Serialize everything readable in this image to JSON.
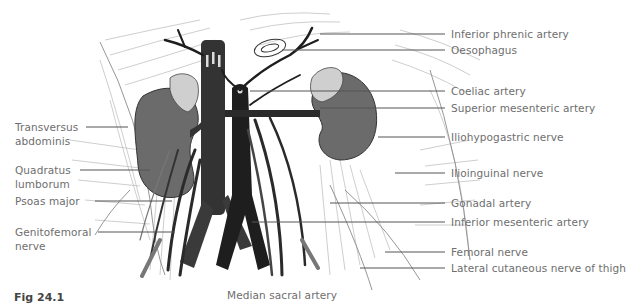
{
  "figure": {
    "caption": "Fig 24.1"
  },
  "labels": {
    "left": [
      {
        "id": "transversus-abdominis",
        "lines": [
          "Transversus",
          "abdominis"
        ]
      },
      {
        "id": "quadratus-lumborum",
        "lines": [
          "Quadratus",
          "lumborum"
        ]
      },
      {
        "id": "psoas-major",
        "lines": [
          "Psoas major"
        ]
      },
      {
        "id": "genitofemoral-nerve",
        "lines": [
          "Genitofemoral",
          "nerve"
        ]
      }
    ],
    "right": [
      {
        "id": "inferior-phrenic-artery",
        "text": "Inferior phrenic artery"
      },
      {
        "id": "oesophagus",
        "text": "Oesophagus"
      },
      {
        "id": "coeliac-artery",
        "text": "Coeliac artery"
      },
      {
        "id": "superior-mesenteric-artery",
        "text": "Superior mesenteric artery"
      },
      {
        "id": "iliohypogastric-nerve",
        "text": "Iliohypogastric nerve"
      },
      {
        "id": "ilioinguinal-nerve",
        "text": "Ilioinguinal nerve"
      },
      {
        "id": "gonadal-artery",
        "text": "Gonadal artery"
      },
      {
        "id": "inferior-mesenteric-artery",
        "text": "Inferior mesenteric artery"
      },
      {
        "id": "femoral-nerve",
        "text": "Femoral nerve"
      },
      {
        "id": "lateral-cutaneous-nerve-of-thigh",
        "text": "Lateral cutaneous nerve of thigh"
      }
    ],
    "bottom": [
      {
        "id": "median-sacral-artery",
        "text": "Median sacral artery"
      }
    ]
  },
  "colors": {
    "vessel_dark": "#1e1e1e",
    "ivc": "#333333",
    "kidney": "#6b6b6b",
    "adrenal": "#cfcfcf",
    "muscle_fibre": "#b9b9b9",
    "label_text": "#6e6e6e",
    "leader_line": "#555555"
  }
}
